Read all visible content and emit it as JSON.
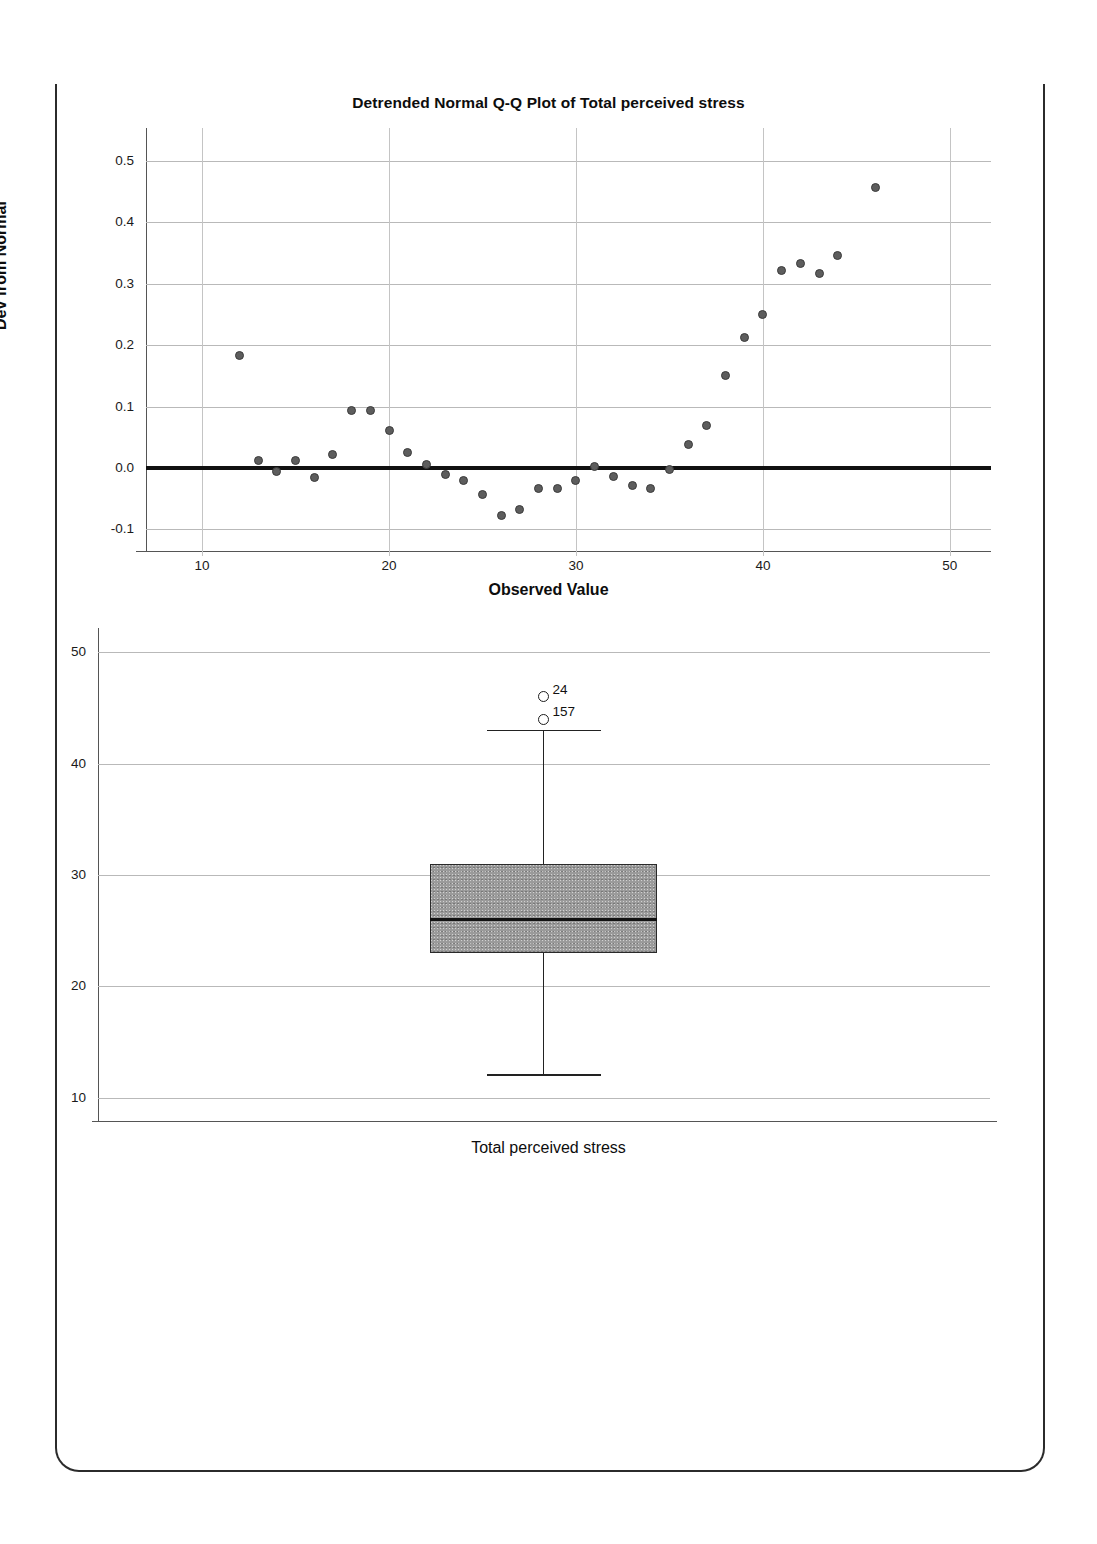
{
  "page": {
    "border_color": "#2b2b2b"
  },
  "chart_data": [
    {
      "type": "scatter",
      "name": "detrended-qq-plot",
      "title": "Detrended Normal Q-Q Plot of Total perceived stress",
      "xlabel": "Observed Value",
      "ylabel": "Dev from Normal",
      "xlim": [
        7.0,
        52.2
      ],
      "ylim": [
        -0.135,
        0.545
      ],
      "xticks": [
        10,
        20,
        30,
        40,
        50
      ],
      "xtick_labels": [
        "10",
        "20",
        "30",
        "40",
        "50"
      ],
      "yticks": [
        -0.1,
        0.0,
        0.1,
        0.2,
        0.3,
        0.4,
        0.5
      ],
      "ytick_labels": [
        "-0.1",
        "0.0",
        "0.1",
        "0.2",
        "0.3",
        "0.4",
        "0.5"
      ],
      "grid": true,
      "legend": "none",
      "reference_line": 0.0,
      "marker_color": "#5d5d5d",
      "x": [
        12,
        13,
        14,
        15,
        16,
        17,
        18,
        19,
        20,
        21,
        22,
        23,
        24,
        25,
        26,
        27,
        28,
        29,
        30,
        31,
        32,
        33,
        34,
        35,
        36,
        37,
        38,
        39,
        40,
        41,
        42,
        43,
        44,
        46
      ],
      "y": [
        0.183,
        0.012,
        -0.005,
        0.013,
        -0.016,
        0.022,
        0.093,
        0.094,
        0.061,
        0.026,
        0.005,
        -0.011,
        -0.02,
        -0.043,
        -0.077,
        -0.067,
        -0.034,
        -0.033,
        -0.02,
        0.002,
        -0.013,
        -0.029,
        -0.033,
        -0.003,
        0.039,
        0.069,
        0.151,
        0.213,
        0.249,
        0.322,
        0.333,
        0.316,
        0.346,
        0.456
      ]
    },
    {
      "type": "boxplot",
      "name": "total-perceived-stress-boxplot",
      "title": "",
      "xlabel": "Total perceived stress",
      "ylabel": "",
      "ylim": [
        7.8,
        52.2
      ],
      "yticks": [
        10,
        20,
        30,
        40,
        50
      ],
      "ytick_labels": [
        "10",
        "20",
        "30",
        "40",
        "50"
      ],
      "grid": true,
      "legend": "none",
      "category": "Total perceived stress",
      "box_fill": "#9a9a9a",
      "stats": {
        "whisker_low": 12,
        "q1": 23,
        "median": 26,
        "q3": 31,
        "whisker_high": 43
      },
      "outliers": [
        {
          "label": "24",
          "value": 46
        },
        {
          "label": "157",
          "value": 44
        }
      ]
    }
  ]
}
